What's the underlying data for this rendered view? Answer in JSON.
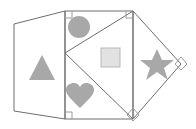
{
  "figure": {
    "canvas": {
      "width": 196,
      "height": 129,
      "background": "#ffffff"
    },
    "stroke_color": "#6e6e6e",
    "marker_color": "#9a9a9a",
    "glyph_color": "#a8a8a8",
    "glyph_square_fill": "#e2e2e2",
    "glyph_square_stroke": "#b8b8b8",
    "panels": [
      {
        "name": "left-panel",
        "shape": "quadrilateral",
        "points": "14,24 65,11 65,119 14,111"
      },
      {
        "name": "center-panel",
        "shape": "rectangle",
        "points": "65,11 133,11 133,119 65,119"
      },
      {
        "name": "right-panel",
        "shape": "triangle",
        "points": "133,11 181,64 133,119"
      },
      {
        "name": "inscribed-diamond",
        "shape": "rotated-square",
        "points": "133,11 65,53 99,119 133,11"
      }
    ],
    "diagonals": [
      {
        "name": "diagonal-upper-left",
        "x1": 133,
        "y1": 11,
        "x2": 65,
        "y2": 53
      },
      {
        "name": "diagonal-lower-left",
        "x1": 65,
        "y1": 53,
        "x2": 133,
        "y2": 119
      },
      {
        "name": "diagonal-upper-right",
        "x1": 133,
        "y1": 11,
        "x2": 181,
        "y2": 64
      },
      {
        "name": "diagonal-lower-right",
        "x1": 181,
        "y1": 64,
        "x2": 133,
        "y2": 119
      }
    ],
    "angle_markers": [
      {
        "name": "right-angle-top-left",
        "x": 65,
        "y": 11,
        "size": 7,
        "type": "square"
      },
      {
        "name": "right-angle-top-right",
        "x": 133,
        "y": 11,
        "size": 7,
        "type": "square"
      },
      {
        "name": "right-angle-bottom-left",
        "x": 65,
        "y": 119,
        "size": 7,
        "type": "square"
      },
      {
        "name": "right-angle-bottom-right",
        "x": 133,
        "y": 119,
        "size": 9,
        "type": "diamond"
      },
      {
        "name": "vertex-marker-right",
        "x": 181,
        "y": 64,
        "size": 7,
        "type": "diamond"
      }
    ],
    "glyphs": [
      {
        "name": "triangle-glyph",
        "symbol": "triangle",
        "cx": 42,
        "cy": 68
      },
      {
        "name": "circle-glyph",
        "symbol": "circle",
        "cx": 79,
        "cy": 27
      },
      {
        "name": "square-glyph",
        "symbol": "square",
        "cx": 110,
        "cy": 57
      },
      {
        "name": "star-glyph",
        "symbol": "star",
        "cx": 157,
        "cy": 65
      },
      {
        "name": "heart-glyph",
        "symbol": "heart",
        "cx": 80,
        "cy": 98
      }
    ]
  }
}
